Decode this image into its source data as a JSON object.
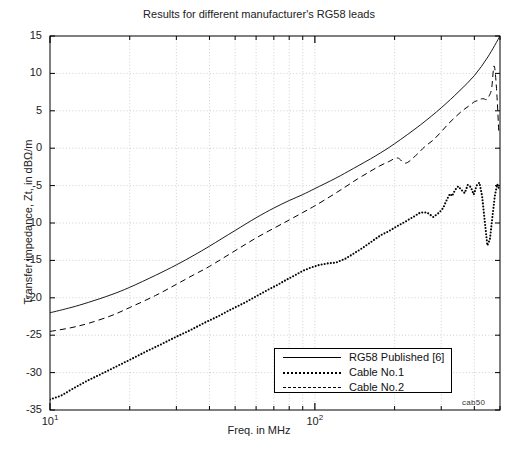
{
  "chart_data": {
    "type": "line",
    "title": "Results for different manufacturer's RG58 leads",
    "xlabel": "Freq. in MHz",
    "ylabel": "Transfer impedance, Zt, in dBΩ/m",
    "xscale": "log",
    "xlim": [
      10,
      500
    ],
    "ylim": [
      -35,
      15
    ],
    "yticks": [
      15,
      10,
      5,
      0,
      -5,
      -10,
      -15,
      -20,
      -25,
      -30,
      -35
    ],
    "ytick_labels": [
      "15",
      "10",
      "5",
      "0",
      "-5",
      "-10",
      "-15",
      "-20",
      "-25",
      "-30",
      "-35"
    ],
    "xtick_major": [
      10,
      100
    ],
    "xtick_major_labels": [
      "10¹",
      "10²"
    ],
    "xtick_minor": [
      20,
      30,
      40,
      50,
      60,
      70,
      80,
      90,
      200,
      300,
      400,
      500
    ],
    "grid": true,
    "legend_position": "lower right",
    "annotation": "cab50",
    "series": [
      {
        "name": "RG58 Published [6]",
        "style": "solid",
        "x": [
          10,
          12,
          14,
          17,
          20,
          25,
          30,
          35,
          40,
          50,
          60,
          70,
          80,
          90,
          100,
          120,
          140,
          170,
          200,
          250,
          300,
          350,
          400,
          450,
          500
        ],
        "y": [
          -22.0,
          -21.3,
          -20.6,
          -19.6,
          -18.6,
          -17.0,
          -15.6,
          -14.3,
          -13.1,
          -11.0,
          -9.3,
          -8.0,
          -7.0,
          -6.2,
          -5.4,
          -4.0,
          -2.7,
          -1.0,
          0.6,
          3.1,
          5.4,
          7.6,
          9.7,
          12.2,
          15.0
        ]
      },
      {
        "name": "Cable No.1",
        "style": "dotted",
        "x": [
          10,
          11,
          12,
          13,
          14,
          16,
          18,
          20,
          23,
          26,
          30,
          34,
          38,
          43,
          48,
          54,
          60,
          66,
          72,
          78,
          84,
          90,
          96,
          104,
          112,
          120,
          130,
          140,
          152,
          165,
          178,
          190,
          205,
          220,
          235,
          250,
          265,
          280,
          295,
          305,
          312,
          318,
          324,
          330,
          338,
          348,
          358,
          368,
          378,
          388,
          398,
          408,
          418,
          428,
          438,
          448,
          458,
          468,
          478,
          488,
          498
        ],
        "y": [
          -33.6,
          -33.1,
          -32.3,
          -31.6,
          -31.0,
          -30.0,
          -29.1,
          -28.3,
          -27.2,
          -26.3,
          -25.2,
          -24.3,
          -23.4,
          -22.5,
          -21.6,
          -20.7,
          -19.8,
          -19.0,
          -18.3,
          -17.6,
          -17.0,
          -16.4,
          -16.0,
          -15.6,
          -15.4,
          -15.3,
          -14.8,
          -14.1,
          -13.3,
          -12.4,
          -11.6,
          -11.1,
          -10.4,
          -9.8,
          -9.2,
          -8.6,
          -8.6,
          -9.2,
          -8.6,
          -8.0,
          -7.2,
          -6.6,
          -6.1,
          -6.4,
          -5.6,
          -5.1,
          -5.6,
          -6.0,
          -4.9,
          -5.2,
          -6.2,
          -5.0,
          -4.6,
          -6.4,
          -9.8,
          -13.0,
          -12.2,
          -9.2,
          -6.4,
          -4.8,
          -5.6
        ]
      },
      {
        "name": "Cable No.2",
        "style": "dashed",
        "x": [
          10,
          12,
          14,
          17,
          20,
          25,
          30,
          35,
          40,
          50,
          60,
          70,
          80,
          90,
          100,
          115,
          130,
          145,
          160,
          175,
          190,
          205,
          220,
          240,
          260,
          280,
          300,
          320,
          340,
          360,
          380,
          400,
          415,
          425,
          435,
          445,
          455,
          465,
          475,
          485,
          495
        ],
        "y": [
          -24.5,
          -24.0,
          -23.4,
          -22.4,
          -21.3,
          -19.7,
          -18.2,
          -16.9,
          -15.8,
          -13.7,
          -12.0,
          -10.7,
          -9.6,
          -8.6,
          -7.7,
          -6.4,
          -5.2,
          -4.1,
          -3.2,
          -2.4,
          -1.8,
          -1.3,
          -2.0,
          -1.0,
          0.2,
          1.1,
          2.2,
          3.3,
          4.2,
          5.0,
          5.6,
          6.2,
          6.4,
          6.6,
          6.6,
          6.5,
          7.0,
          8.0,
          11.0,
          8.0,
          2.0
        ]
      }
    ]
  }
}
